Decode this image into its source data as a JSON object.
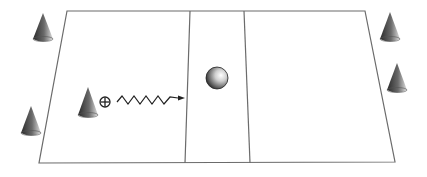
{
  "diagram": {
    "type": "drill-field-diagram",
    "field": {
      "shape": "trapezoid",
      "zones": [
        "left-zone",
        "center-zone",
        "right-zone"
      ],
      "line_color": "#6b6b6b"
    },
    "objects": [
      {
        "kind": "cone",
        "position": "top-left-outside"
      },
      {
        "kind": "cone",
        "position": "bottom-left-outside"
      },
      {
        "kind": "cone",
        "position": "left-zone-middle"
      },
      {
        "kind": "player",
        "marker": "⊕",
        "position": "left-zone-middle"
      },
      {
        "kind": "dribble-path",
        "style": "zigzag-arrow",
        "direction": "toward-center"
      },
      {
        "kind": "ball",
        "position": "center-zone"
      },
      {
        "kind": "cone",
        "position": "top-right-outside"
      },
      {
        "kind": "cone",
        "position": "right-outside-middle"
      }
    ],
    "colors": {
      "cone_dark": "#2e2e2e",
      "cone_light": "#d8d8d8",
      "line": "#6b6b6b",
      "background": "#ffffff"
    }
  }
}
